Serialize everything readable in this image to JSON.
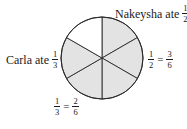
{
  "diagram": {
    "type": "fraction-circle",
    "total_parts": 6,
    "center": [
      102,
      58
    ],
    "radius": 41,
    "colors": {
      "shaded": "#e3e3e3",
      "unshaded": "#ffffff",
      "stroke": "#2a2a2a"
    },
    "sectors": [
      {
        "index": 0,
        "start_deg": -90,
        "end_deg": -30,
        "shaded": true,
        "owner": "Nakeysha"
      },
      {
        "index": 1,
        "start_deg": -30,
        "end_deg": 30,
        "shaded": true,
        "owner": "Nakeysha"
      },
      {
        "index": 2,
        "start_deg": 30,
        "end_deg": 90,
        "shaded": true,
        "owner": "Nakeysha"
      },
      {
        "index": 3,
        "start_deg": 90,
        "end_deg": 150,
        "shaded": true,
        "owner": "Carla"
      },
      {
        "index": 4,
        "start_deg": 150,
        "end_deg": 210,
        "shaded": true,
        "owner": "Carla"
      },
      {
        "index": 5,
        "start_deg": 210,
        "end_deg": 270,
        "shaded": false,
        "owner": ""
      }
    ]
  },
  "labels": {
    "nakeysha": {
      "text": "Nakeysha ate",
      "num": "1",
      "den": "2"
    },
    "carla": {
      "text": "Carla ate",
      "num": "1",
      "den": "3"
    },
    "right_equation": {
      "lhs_num": "1",
      "lhs_den": "2",
      "eq": "=",
      "rhs_num": "3",
      "rhs_den": "6"
    },
    "bottom_equation": {
      "lhs_num": "1",
      "lhs_den": "3",
      "eq": "=",
      "rhs_num": "2",
      "rhs_den": "6"
    }
  }
}
